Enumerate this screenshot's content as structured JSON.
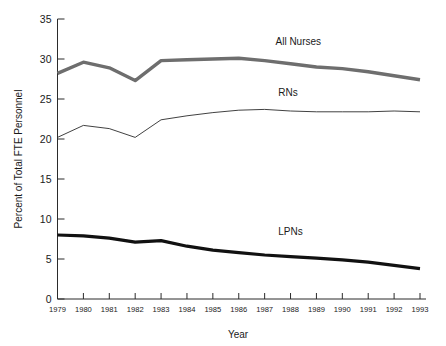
{
  "chart_data": {
    "type": "line",
    "title": "",
    "xlabel": "Year",
    "ylabel": "Percent of Total FTE Personnel",
    "x": [
      1979,
      1980,
      1981,
      1982,
      1983,
      1984,
      1985,
      1986,
      1987,
      1988,
      1989,
      1990,
      1991,
      1992,
      1993
    ],
    "xtick_labels": [
      "1979",
      "1980",
      "1981",
      "1982",
      "1983",
      "1984",
      "1985",
      "1986",
      "1987",
      "1988",
      "1989",
      "1990",
      "1991",
      "1992",
      "1993"
    ],
    "ytick_labels": [
      "0",
      "5",
      "10",
      "15",
      "20",
      "25",
      "30",
      "35"
    ],
    "ytick_values": [
      0,
      5,
      10,
      15,
      20,
      25,
      30,
      35
    ],
    "xlim": [
      1979,
      1993
    ],
    "ylim": [
      0,
      35
    ],
    "grid": false,
    "legend": "inline-labels",
    "series": [
      {
        "name": "All Nurses",
        "color": "#6e6e6e",
        "line_width": 3.4,
        "label_x": 1988.3,
        "label_y": 31.7,
        "values": [
          28.2,
          29.6,
          28.9,
          27.3,
          29.8,
          29.9,
          30.0,
          30.1,
          29.8,
          29.4,
          29.0,
          28.8,
          28.4,
          27.9,
          27.4
        ]
      },
      {
        "name": "RNs",
        "color": "#2b2b2b",
        "line_width": 0.9,
        "label_x": 1987.9,
        "label_y": 25.4,
        "values": [
          20.2,
          21.7,
          21.3,
          20.2,
          22.4,
          22.9,
          23.3,
          23.6,
          23.7,
          23.5,
          23.4,
          23.4,
          23.4,
          23.5,
          23.4
        ]
      },
      {
        "name": "LPNs",
        "color": "#111111",
        "line_width": 3.2,
        "label_x": 1988.0,
        "label_y": 8.0,
        "values": [
          8.0,
          7.9,
          7.6,
          7.1,
          7.3,
          6.6,
          6.1,
          5.8,
          5.5,
          5.3,
          5.1,
          4.9,
          4.6,
          4.2,
          3.8
        ]
      }
    ]
  },
  "figure": {
    "background": "#ffffff",
    "axis_color": "#2b2b2b"
  }
}
